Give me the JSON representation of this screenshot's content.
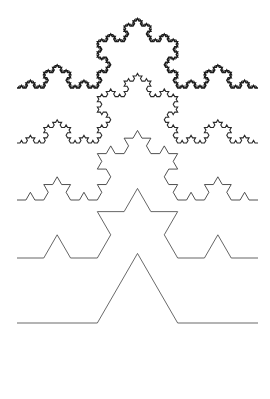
{
  "figure": {
    "background_color": "#ffffff",
    "width": 270,
    "height": 399,
    "x_start": 17,
    "x_end": 258
  },
  "chart_data": {
    "type": "line",
    "subtitle": "",
    "xlabel": "",
    "ylabel": "",
    "grid": false,
    "legend_position": "none",
    "xlim": [
      17,
      258
    ],
    "ylim": [
      0,
      399
    ],
    "series": [
      {
        "name": "Koch curve order 5",
        "order": 5,
        "baseline_y": 88,
        "apex_y": 18,
        "segment_count": 1024,
        "stroke_color": "#1c1c1c",
        "stroke_width": 1.4
      },
      {
        "name": "Koch curve order 4",
        "order": 4,
        "baseline_y": 143,
        "apex_y": 73,
        "segment_count": 256,
        "stroke_color": "#2a2a2a",
        "stroke_width": 1.1
      },
      {
        "name": "Koch curve order 3",
        "order": 3,
        "baseline_y": 200,
        "apex_y": 130,
        "segment_count": 64,
        "stroke_color": "#3d3d3d",
        "stroke_width": 0.9
      },
      {
        "name": "Koch curve order 2",
        "order": 2,
        "baseline_y": 258,
        "apex_y": 188,
        "segment_count": 16,
        "stroke_color": "#4a4a4a",
        "stroke_width": 0.85
      },
      {
        "name": "Koch curve order 1",
        "order": 1,
        "baseline_y": 323,
        "apex_y": 253,
        "segment_count": 4,
        "stroke_color": "#4f4f4f",
        "stroke_width": 0.85
      }
    ]
  },
  "gradient_rule": {
    "name": "gradient-divider",
    "y": 382,
    "x_start": 17,
    "x_end": 258,
    "thickness": 2,
    "color_start": "#8a7ad2",
    "color_mid": "#8f8f8a",
    "color_end": "#83876f"
  }
}
